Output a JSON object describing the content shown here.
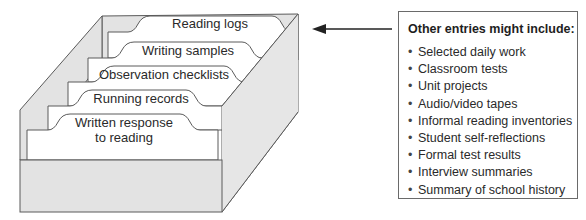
{
  "figure": {
    "file_box": {
      "tabs": [
        {
          "label": "Reading logs"
        },
        {
          "label": "Writing samples"
        },
        {
          "label": "Observation checklists"
        },
        {
          "label": "Running records"
        },
        {
          "label_line1": "Written response",
          "label_line2": "to reading"
        }
      ]
    },
    "arrow": {
      "direction": "left"
    },
    "entries_panel": {
      "title": "Other entries might include:",
      "bullet": "•",
      "items": [
        "Selected daily work",
        "Classroom tests",
        "Unit projects",
        "Audio/video tapes",
        "Informal reading inventories",
        "Student self-reflections",
        "Formal test results",
        "Interview summaries",
        "Summary of school history"
      ]
    },
    "colors": {
      "box_fill": "#e3e3e3",
      "box_stroke": "#5a5a5a",
      "card_fill": "#ffffff",
      "text": "#2a2a2a"
    }
  }
}
